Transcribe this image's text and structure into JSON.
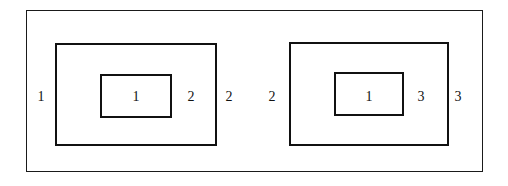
{
  "diagram": {
    "background_color": "#ffffff",
    "stroke_color": "#111111",
    "outer_frame": {
      "name": "outer-frame",
      "x": 26,
      "y": 10,
      "width": 457,
      "height": 162,
      "stroke_width": 1
    },
    "groups": [
      {
        "name": "left-group",
        "middle_box": {
          "x": 55,
          "y": 43,
          "width": 162,
          "height": 103,
          "stroke_width": 2
        },
        "inner_box": {
          "x": 100,
          "y": 74,
          "width": 72,
          "height": 44,
          "stroke_width": 2
        },
        "labels": [
          {
            "name": "label-outer-left",
            "text": "1",
            "x": 41,
            "y": 97
          },
          {
            "name": "label-inner-center",
            "text": "1",
            "x": 136,
            "y": 97
          },
          {
            "name": "label-middle-right",
            "text": "2",
            "x": 191,
            "y": 97
          },
          {
            "name": "label-outer-right",
            "text": "2",
            "x": 229,
            "y": 97
          }
        ]
      },
      {
        "name": "right-group",
        "middle_box": {
          "x": 289,
          "y": 42,
          "width": 160,
          "height": 104,
          "stroke_width": 2
        },
        "inner_box": {
          "x": 334,
          "y": 72,
          "width": 70,
          "height": 44,
          "stroke_width": 2
        },
        "labels": [
          {
            "name": "label-outer-left",
            "text": "2",
            "x": 272,
            "y": 97
          },
          {
            "name": "label-inner-center",
            "text": "1",
            "x": 369,
            "y": 97
          },
          {
            "name": "label-middle-right",
            "text": "3",
            "x": 421,
            "y": 97
          },
          {
            "name": "label-outer-right",
            "text": "3",
            "x": 458,
            "y": 97
          }
        ]
      }
    ]
  }
}
